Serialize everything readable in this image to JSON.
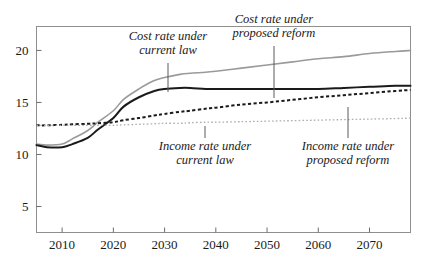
{
  "chart_data": {
    "type": "line",
    "title": "",
    "xlabel": "",
    "ylabel": "",
    "xlim": [
      2005,
      2078
    ],
    "ylim": [
      2.5,
      22.3
    ],
    "grid": false,
    "legend_position": "inline-annotations",
    "xticks": [
      2010,
      2020,
      2030,
      2040,
      2050,
      2060,
      2070
    ],
    "yticks": [
      5,
      10,
      15,
      20
    ],
    "x": [
      2005,
      2007,
      2010,
      2012,
      2015,
      2017,
      2020,
      2022,
      2025,
      2028,
      2030,
      2033,
      2035,
      2038,
      2040,
      2045,
      2050,
      2055,
      2060,
      2065,
      2070,
      2075,
      2078
    ],
    "series": [
      {
        "name": "Cost rate under current law",
        "style": "solid",
        "color": "#9a9a9a",
        "width": 1.6,
        "values": [
          11.0,
          10.9,
          11.0,
          11.5,
          12.3,
          13.1,
          14.2,
          15.3,
          16.3,
          17.1,
          17.4,
          17.7,
          17.8,
          17.9,
          18.0,
          18.3,
          18.6,
          18.9,
          19.2,
          19.4,
          19.7,
          19.9,
          20.0
        ]
      },
      {
        "name": "Cost rate under proposed reform",
        "style": "solid",
        "color": "#1a1a1a",
        "width": 2.0,
        "values": [
          10.9,
          10.7,
          10.7,
          11.0,
          11.6,
          12.4,
          13.5,
          14.6,
          15.5,
          16.1,
          16.3,
          16.4,
          16.4,
          16.3,
          16.3,
          16.3,
          16.3,
          16.3,
          16.3,
          16.4,
          16.5,
          16.6,
          16.6
        ]
      },
      {
        "name": "Income rate under proposed reform",
        "style": "dashed",
        "color": "#1a1a1a",
        "width": 2.0,
        "values": [
          12.8,
          12.8,
          12.85,
          12.9,
          12.95,
          13.0,
          13.1,
          13.3,
          13.5,
          13.75,
          13.9,
          14.1,
          14.2,
          14.4,
          14.5,
          14.8,
          15.0,
          15.25,
          15.5,
          15.7,
          15.9,
          16.1,
          16.2
        ]
      },
      {
        "name": "Income rate under current law",
        "style": "dotted",
        "color": "#adadad",
        "width": 1.3,
        "values": [
          12.8,
          12.8,
          12.8,
          12.8,
          12.8,
          12.8,
          12.8,
          12.85,
          12.9,
          12.95,
          13.0,
          13.0,
          13.05,
          13.1,
          13.1,
          13.15,
          13.2,
          13.25,
          13.3,
          13.35,
          13.4,
          13.45,
          13.5
        ]
      }
    ],
    "annotations": [
      {
        "id": "cost-current-law",
        "lines": [
          "Cost rate under",
          "current law"
        ],
        "text_x": 168,
        "text_y": 40,
        "leader_x": 168,
        "leader_y1": 63,
        "leader_y2": 92
      },
      {
        "id": "cost-proposed-reform",
        "lines": [
          "Cost rate under",
          "proposed reform"
        ],
        "text_x": 274,
        "text_y": 23,
        "leader_x": 274,
        "leader_y1": 46,
        "leader_y2": 98
      },
      {
        "id": "income-current-law",
        "lines": [
          "Income rate under",
          "current law"
        ],
        "text_x": 205,
        "text_y": 150,
        "leader_x": 205,
        "leader_y1": 126,
        "leader_y2": 138
      },
      {
        "id": "income-proposed-reform",
        "lines": [
          "Income rate under",
          "proposed reform"
        ],
        "text_x": 348,
        "text_y": 150,
        "leader_x": 348,
        "leader_y1": 107,
        "leader_y2": 138
      }
    ]
  },
  "axes": {
    "xtick_labels": [
      "2010",
      "2020",
      "2030",
      "2040",
      "2050",
      "2060",
      "2070"
    ],
    "ytick_labels": [
      "20",
      "15",
      "10",
      "5"
    ]
  },
  "ghost": {
    "cropped_title_fragment": ""
  }
}
